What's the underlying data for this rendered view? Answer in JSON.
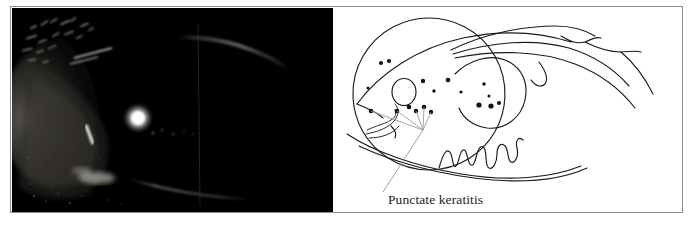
{
  "figure": {
    "type": "medical-figure-pair",
    "panels": [
      {
        "id": "photograph",
        "kind": "slit-lamp-photograph",
        "background_color": "#000000",
        "description": "Dark slit-lamp photograph of an eye showing a bright corneal light reflex, illuminated nasal conjunctiva and faint limbal arcs"
      },
      {
        "id": "line-drawing",
        "kind": "schematic-line-drawing",
        "background_color": "#ffffff",
        "description": "Pen line drawing of the same eye, with upper and lower eyelids, limbus circle, pupil, scattered punctate dots and a dendritic squiggle"
      }
    ]
  },
  "annotation": {
    "label": "Punctate keratitis",
    "leader_color": "#9a9a9a",
    "ink_color": "#1b1b1b"
  },
  "drawing": {
    "punctate_dots": [
      {
        "cx": 48,
        "cy": 55,
        "r": 2.1
      },
      {
        "cx": 56,
        "cy": 53,
        "r": 2.1
      },
      {
        "cx": 35,
        "cy": 80,
        "r": 1.5
      },
      {
        "cx": 90,
        "cy": 73,
        "r": 2.2
      },
      {
        "cx": 101,
        "cy": 83,
        "r": 1.7
      },
      {
        "cx": 115,
        "cy": 72,
        "r": 2.3
      },
      {
        "cx": 128,
        "cy": 84,
        "r": 1.6
      },
      {
        "cx": 151,
        "cy": 76,
        "r": 1.7
      },
      {
        "cx": 156,
        "cy": 88,
        "r": 1.5
      },
      {
        "cx": 146,
        "cy": 97,
        "r": 2.6
      },
      {
        "cx": 158,
        "cy": 98,
        "r": 2.6
      },
      {
        "cx": 166,
        "cy": 95,
        "r": 2.1
      },
      {
        "cx": 38,
        "cy": 103,
        "r": 2.3
      },
      {
        "cx": 64,
        "cy": 103,
        "r": 2.3
      },
      {
        "cx": 76,
        "cy": 99,
        "r": 2.3
      },
      {
        "cx": 83,
        "cy": 103,
        "r": 2.2
      },
      {
        "cx": 91,
        "cy": 99,
        "r": 2.3
      },
      {
        "cx": 98,
        "cy": 104,
        "r": 2.2
      }
    ],
    "pupil": {
      "cx": 71,
      "cy": 84,
      "rx": 12,
      "ry": 13.5
    },
    "limbus": {
      "cx": 96,
      "cy": 86,
      "r": 76
    }
  }
}
